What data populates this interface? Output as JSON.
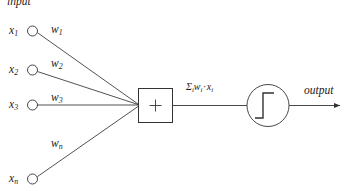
{
  "diagram": {
    "title_label": "input",
    "output_label": "output",
    "sum_symbol": "+",
    "stroke_color": "#333333",
    "text_color": "#1a1a1a",
    "background_color": "#ffffff",
    "inputs": [
      {
        "var": "x",
        "sub": "1",
        "weight_var": "w",
        "weight_sub": "1"
      },
      {
        "var": "x",
        "sub": "2",
        "weight_var": "w",
        "weight_sub": "2"
      },
      {
        "var": "x",
        "sub": "3",
        "weight_var": "w",
        "weight_sub": "3"
      },
      {
        "var": "x",
        "sub": "n",
        "weight_var": "w",
        "weight_sub": "n"
      }
    ],
    "formula": {
      "sigma": "Σ",
      "sigma_sub": "i",
      "weight_var": "w",
      "weight_sub": "i",
      "dot": "·",
      "input_var": "x",
      "input_sub": "i"
    },
    "activation": {
      "name": "step-function",
      "description": "Heaviside step function"
    }
  }
}
